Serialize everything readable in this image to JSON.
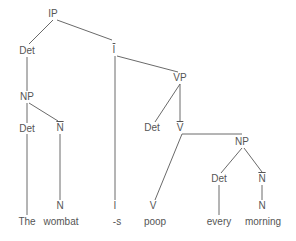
{
  "diagram": {
    "type": "syntax-tree",
    "nodes": [
      {
        "id": "ip",
        "label": "IP",
        "x": 53,
        "y": 14
      },
      {
        "id": "det1",
        "label": "Det",
        "x": 27,
        "y": 51
      },
      {
        "id": "ibar",
        "label": "I",
        "bar": true,
        "x": 114,
        "y": 50
      },
      {
        "id": "np1",
        "label": "NP",
        "x": 27,
        "y": 97
      },
      {
        "id": "det2",
        "label": "Det",
        "x": 27,
        "y": 129
      },
      {
        "id": "nbar1",
        "label": "N",
        "bar": true,
        "x": 60,
        "y": 128
      },
      {
        "id": "n1",
        "label": "N",
        "x": 60,
        "y": 206
      },
      {
        "id": "i",
        "label": "I",
        "x": 115,
        "y": 206
      },
      {
        "id": "vp",
        "label": "VP",
        "x": 180,
        "y": 78
      },
      {
        "id": "det3",
        "label": "Det",
        "x": 152,
        "y": 128
      },
      {
        "id": "vbar",
        "label": "V",
        "bar": true,
        "x": 180,
        "y": 128
      },
      {
        "id": "np2",
        "label": "NP",
        "x": 242,
        "y": 142
      },
      {
        "id": "det4",
        "label": "Det",
        "x": 219,
        "y": 179
      },
      {
        "id": "nbar2",
        "label": "N",
        "bar": true,
        "x": 262,
        "y": 179
      },
      {
        "id": "v",
        "label": "V",
        "x": 153,
        "y": 206
      },
      {
        "id": "n2",
        "label": "N",
        "x": 262,
        "y": 206
      }
    ],
    "words": [
      {
        "id": "w-the",
        "label": "The",
        "x": 27,
        "y": 222
      },
      {
        "id": "w-wombat",
        "label": "wombat",
        "x": 61,
        "y": 222
      },
      {
        "id": "w-s",
        "label": "-s",
        "x": 117,
        "y": 222
      },
      {
        "id": "w-poop",
        "label": "poop",
        "x": 155,
        "y": 222
      },
      {
        "id": "w-every",
        "label": "every",
        "x": 219,
        "y": 222
      },
      {
        "id": "w-morning",
        "label": "morning",
        "x": 263,
        "y": 222
      }
    ],
    "edges": [
      [
        53,
        20,
        29,
        44
      ],
      [
        57,
        20,
        112,
        40
      ],
      [
        27,
        57,
        27,
        91
      ],
      [
        27,
        103,
        27,
        123
      ],
      [
        29,
        103,
        58,
        121
      ],
      [
        27,
        134,
        27,
        215
      ],
      [
        60,
        134,
        60,
        200
      ],
      [
        115,
        56,
        115,
        200
      ],
      [
        117,
        56,
        178,
        72
      ],
      [
        180,
        84,
        155,
        122
      ],
      [
        180,
        84,
        180,
        122
      ],
      [
        182,
        134,
        155,
        200
      ],
      [
        182,
        134,
        242,
        134
      ],
      [
        242,
        148,
        221,
        173
      ],
      [
        244,
        148,
        262,
        172
      ],
      [
        219,
        185,
        219,
        215
      ],
      [
        262,
        185,
        262,
        200
      ]
    ]
  }
}
